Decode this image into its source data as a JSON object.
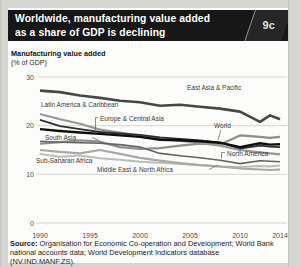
{
  "header": {
    "title_line1": "Worldwide, manufacturing value added",
    "title_line2": "as a share of GDP is declining",
    "figure_tag": "9c"
  },
  "source": {
    "label": "Source:",
    "text": "Organisation for Economic Co-operation and Development; World Bank national accounts data; World Development Indicators database (NV.IND.MANF.ZS)."
  },
  "colors": {
    "page_bg": "#d5d5d1",
    "panel_bg": "#fcfcfa",
    "header_bg": "#171717",
    "header_text": "#ffffff",
    "figure_tab_bg": "#262626",
    "grid": "#cbcbc7",
    "axis_text": "#4f4f4f"
  },
  "chart_data": {
    "type": "line",
    "title": "Manufacturing value added",
    "units_label": "(% of GDP)",
    "xlabel": "",
    "ylabel": "% of GDP",
    "xlim": [
      1990,
      2014
    ],
    "ylim": [
      0,
      30
    ],
    "xticks": [
      1990,
      1995,
      2000,
      2005,
      2010,
      2014
    ],
    "yticks": [
      30,
      20,
      10,
      0
    ],
    "grid": "horizontal",
    "legend": "inline-labels",
    "x": [
      1990,
      1992,
      1994,
      1996,
      1998,
      2000,
      2002,
      2004,
      2006,
      2008,
      2010,
      2012,
      2013,
      2014
    ],
    "series": [
      {
        "name": "Middle East & North Africa",
        "color": "#bcbcbc",
        "width": 2.0,
        "values": [
          14.2,
          13.6,
          13.9,
          13.3,
          13.0,
          12.6,
          12.4,
          12.1,
          11.9,
          11.6,
          11.5,
          11.7,
          11.6,
          11.8
        ]
      },
      {
        "name": "Sub-Saharan Africa",
        "color": "#a8a8a8",
        "width": 2.2,
        "values": [
          15.0,
          14.6,
          14.3,
          15.0,
          14.2,
          13.4,
          12.8,
          12.3,
          11.9,
          11.6,
          11.2,
          11.0,
          10.9,
          11.0
        ]
      },
      {
        "name": "South Asia",
        "color": "#8e8e8e",
        "width": 2.2,
        "values": [
          16.3,
          16.6,
          17.0,
          16.7,
          15.6,
          15.2,
          15.4,
          15.9,
          16.3,
          16.1,
          18.0,
          17.7,
          17.5,
          17.7
        ]
      },
      {
        "name": "Latin America & Caribbean",
        "color": "#979797",
        "width": 2.2,
        "values": [
          22.4,
          21.3,
          20.4,
          19.2,
          18.6,
          17.9,
          17.3,
          16.9,
          16.5,
          15.9,
          15.0,
          14.5,
          14.3,
          14.1
        ]
      },
      {
        "name": "North America",
        "color": "#646464",
        "width": 1.6,
        "values": [
          16.8,
          16.6,
          16.5,
          16.4,
          16.1,
          15.6,
          14.3,
          13.8,
          13.4,
          12.9,
          12.2,
          12.8,
          12.7,
          12.6
        ]
      },
      {
        "name": "Europe & Central Asia",
        "color": "#303030",
        "width": 1.8,
        "values": [
          21.2,
          19.9,
          19.3,
          18.7,
          18.4,
          18.1,
          17.6,
          17.3,
          17.0,
          16.5,
          15.3,
          15.9,
          15.7,
          15.6
        ]
      },
      {
        "name": "World",
        "color": "#0e0e0e",
        "width": 2.4,
        "values": [
          19.3,
          18.9,
          18.6,
          18.3,
          18.0,
          17.7,
          17.1,
          17.0,
          16.8,
          16.5,
          15.6,
          16.4,
          16.1,
          16.2
        ]
      },
      {
        "name": "East Asia & Pacific",
        "color": "#474747",
        "width": 2.6,
        "values": [
          27.2,
          26.9,
          26.2,
          25.7,
          25.1,
          24.8,
          24.1,
          24.3,
          23.9,
          23.5,
          22.9,
          20.8,
          22.1,
          21.3
        ]
      }
    ]
  }
}
